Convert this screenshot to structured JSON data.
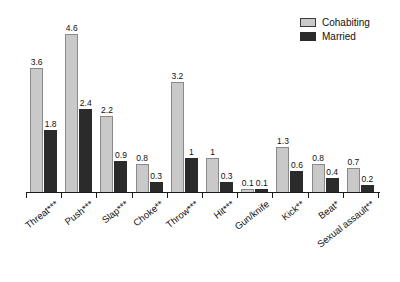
{
  "chart": {
    "type": "bar",
    "background_color": "#ffffff"
  },
  "legend": {
    "position": "top-right",
    "items": [
      {
        "label": "Cohabiting",
        "color": "#c9c9c9",
        "swatch_name": "legend-swatch-cohabiting"
      },
      {
        "label": "Married",
        "color": "#2b2b2b",
        "swatch_name": "legend-swatch-married"
      }
    ]
  },
  "chart_data": {
    "type": "bar",
    "title": "",
    "subtitle": "",
    "xlabel": "",
    "ylabel": "",
    "ylim": [
      0,
      5
    ],
    "grid": false,
    "legend_position": "top-right",
    "categories": [
      "Threat***",
      "Push***",
      "Slap***",
      "Choke**",
      "Throw***",
      "Hit***",
      "Gun/knife",
      "Kick**",
      "Beat*",
      "Sexual assault**"
    ],
    "series": [
      {
        "name": "Cohabiting",
        "color": "#c9c9c9",
        "values": [
          3.6,
          4.6,
          2.2,
          0.8,
          3.2,
          1,
          0.1,
          1.3,
          0.8,
          0.7
        ],
        "labels": [
          "3.6",
          "4.6",
          "2.2",
          "0.8",
          "3.2",
          "1",
          "0.1",
          "1.3",
          "0.8",
          "0.7"
        ]
      },
      {
        "name": "Married",
        "color": "#2b2b2b",
        "values": [
          1.8,
          2.4,
          0.9,
          0.3,
          1,
          0.3,
          0.1,
          0.6,
          0.4,
          0.2
        ],
        "labels": [
          "1.8",
          "2.4",
          "0.9",
          "0.3",
          "1",
          "0.3",
          "0.1",
          "0.6",
          "0.4",
          "0.2"
        ]
      }
    ]
  }
}
